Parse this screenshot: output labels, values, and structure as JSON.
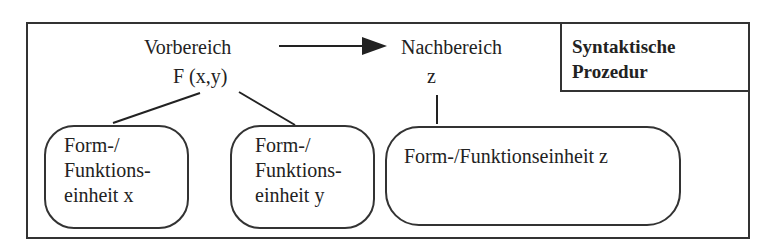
{
  "diagram": {
    "title_line1": "Syntaktische",
    "title_line2": "Prozedur",
    "domain_label": "Vorbereich",
    "domain_formula": "F (x,y)",
    "codomain_label": "Nachbereich",
    "codomain_var": "z",
    "nodes": [
      {
        "line1": "Form-/",
        "line2": "Funktions-",
        "line3": "einheit x"
      },
      {
        "line1": "Form-/",
        "line2": "Funktions-",
        "line3": "einheit y"
      },
      {
        "line1": "Form-/Funktionseinheit z"
      }
    ],
    "edges": [
      {
        "from": "Vorbereich",
        "to": "Nachbereich",
        "type": "arrow"
      },
      {
        "from": "F (x,y)",
        "to": "Form-/Funktionseinheit x",
        "type": "line"
      },
      {
        "from": "F (x,y)",
        "to": "Form-/Funktionseinheit y",
        "type": "line"
      },
      {
        "from": "z",
        "to": "Form-/Funktionseinheit z",
        "type": "line"
      }
    ]
  }
}
